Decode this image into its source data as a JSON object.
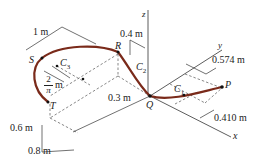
{
  "diagram": {
    "points": {
      "P": "P",
      "Q": "Q",
      "R": "R",
      "S": "S",
      "T": "T"
    },
    "centroids": {
      "C1": "C",
      "C1_sub": "1",
      "C2": "C",
      "C2_sub": "2",
      "C3": "C",
      "C3_sub": "3"
    },
    "axes": {
      "x": "x",
      "y": "y",
      "z": "z"
    },
    "dimensions": {
      "d_1m": "1 m",
      "d_04m": "0.4 m",
      "d_0574m": "0.574 m",
      "d_0410m": "0.410 m",
      "d_03m": "0.3 m",
      "d_06m": "0.6 m",
      "d_08m": "0.8 m",
      "d_2pi_num": "2",
      "d_2pi_den": "π",
      "d_2pi_unit": "m"
    },
    "colors": {
      "curve": "#7a2a1a",
      "lines": "#333333",
      "dashed": "#555555"
    }
  }
}
